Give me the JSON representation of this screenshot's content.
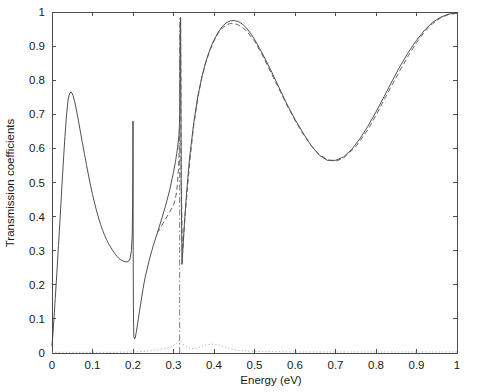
{
  "chart_data": {
    "type": "line",
    "title": "",
    "xlabel": "Energy   (eV)",
    "ylabel": "Transmission coefficients",
    "xlim": [
      0,
      1
    ],
    "ylim": [
      0,
      1
    ],
    "grid": false,
    "legend": "none",
    "xticks": [
      "0",
      "0.1",
      "0.2",
      "0.3",
      "0.4",
      "0.5",
      "0.6",
      "0.7",
      "0.8",
      "0.9",
      "1"
    ],
    "yticks": [
      "0",
      "0.1",
      "0.2",
      "0.3",
      "0.4",
      "0.5",
      "0.6",
      "0.7",
      "0.8",
      "0.9",
      "1"
    ],
    "xtick_values": [
      0,
      0.1,
      0.2,
      0.3,
      0.4,
      0.5,
      0.6,
      0.7,
      0.8,
      0.9,
      1
    ],
    "ytick_values": [
      0,
      0.1,
      0.2,
      0.3,
      0.4,
      0.5,
      0.6,
      0.7,
      0.8,
      0.9,
      1
    ],
    "annotations": [
      {
        "label": "first resonance peak",
        "x": 0.05,
        "y": 0.765
      },
      {
        "label": "local minimum",
        "x": 0.16,
        "y": 0.265
      },
      {
        "label": "Fano antiresonance",
        "x": 0.2,
        "y": 0.04
      },
      {
        "label": "sharp resonance spike",
        "x": 0.315,
        "y": 0.98
      },
      {
        "label": "broad transmission maximum",
        "x": 0.45,
        "y": 0.975
      },
      {
        "label": "broad minimum",
        "x": 0.65,
        "y": 0.565
      },
      {
        "label": "approach to unity",
        "x": 1.0,
        "y": 0.995
      }
    ],
    "series": [
      {
        "name": "solid",
        "style": "solid",
        "color": "#3c3c3c",
        "x": [
          0,
          0.004,
          0.008,
          0.012,
          0.016,
          0.02,
          0.024,
          0.028,
          0.032,
          0.036,
          0.04,
          0.044,
          0.048,
          0.052,
          0.056,
          0.06,
          0.065,
          0.07,
          0.075,
          0.08,
          0.085,
          0.09,
          0.095,
          0.1,
          0.105,
          0.11,
          0.115,
          0.12,
          0.125,
          0.13,
          0.135,
          0.14,
          0.145,
          0.15,
          0.155,
          0.16,
          0.165,
          0.17,
          0.175,
          0.18,
          0.185,
          0.19,
          0.193,
          0.196,
          0.198,
          0.199,
          0.1995,
          0.1998,
          0.2,
          0.2002,
          0.2005,
          0.201,
          0.2015,
          0.202,
          0.203,
          0.205,
          0.208,
          0.212,
          0.216,
          0.22,
          0.225,
          0.23,
          0.24,
          0.25,
          0.26,
          0.27,
          0.28,
          0.29,
          0.3,
          0.305,
          0.308,
          0.31,
          0.312,
          0.3135,
          0.3145,
          0.3152,
          0.3158,
          0.3163,
          0.3168,
          0.3175,
          0.319,
          0.321,
          0.324,
          0.328,
          0.333,
          0.34,
          0.35,
          0.36,
          0.37,
          0.38,
          0.39,
          0.4,
          0.41,
          0.42,
          0.43,
          0.44,
          0.45,
          0.46,
          0.47,
          0.48,
          0.49,
          0.5,
          0.52,
          0.54,
          0.56,
          0.58,
          0.6,
          0.62,
          0.64,
          0.66,
          0.68,
          0.7,
          0.72,
          0.74,
          0.76,
          0.78,
          0.8,
          0.82,
          0.84,
          0.86,
          0.88,
          0.9,
          0.92,
          0.94,
          0.96,
          0.98,
          1
        ],
        "y": [
          0.02,
          0.085,
          0.16,
          0.235,
          0.315,
          0.395,
          0.48,
          0.56,
          0.635,
          0.7,
          0.745,
          0.763,
          0.765,
          0.755,
          0.737,
          0.715,
          0.683,
          0.65,
          0.617,
          0.585,
          0.553,
          0.522,
          0.492,
          0.465,
          0.44,
          0.417,
          0.396,
          0.377,
          0.36,
          0.345,
          0.331,
          0.32,
          0.31,
          0.3,
          0.292,
          0.284,
          0.278,
          0.273,
          0.27,
          0.268,
          0.267,
          0.27,
          0.278,
          0.3,
          0.34,
          0.42,
          0.5,
          0.6,
          0.68,
          0.5,
          0.3,
          0.14,
          0.075,
          0.05,
          0.043,
          0.042,
          0.06,
          0.09,
          0.122,
          0.152,
          0.19,
          0.222,
          0.272,
          0.315,
          0.352,
          0.39,
          0.43,
          0.475,
          0.53,
          0.562,
          0.585,
          0.602,
          0.622,
          0.64,
          0.66,
          0.7,
          0.78,
          0.88,
          0.95,
          0.98,
          0.5,
          0.26,
          0.32,
          0.4,
          0.48,
          0.575,
          0.675,
          0.752,
          0.81,
          0.855,
          0.89,
          0.918,
          0.94,
          0.957,
          0.968,
          0.974,
          0.975,
          0.972,
          0.965,
          0.953,
          0.938,
          0.92,
          0.877,
          0.83,
          0.78,
          0.73,
          0.685,
          0.645,
          0.608,
          0.58,
          0.565,
          0.565,
          0.575,
          0.597,
          0.628,
          0.665,
          0.707,
          0.752,
          0.798,
          0.842,
          0.882,
          0.917,
          0.947,
          0.97,
          0.985,
          0.994,
          0.997
        ]
      },
      {
        "name": "dashed",
        "style": "dashed",
        "color": "#555555",
        "x": [
          0.26,
          0.28,
          0.3,
          0.305,
          0.308,
          0.31,
          0.3125,
          0.3138,
          0.3148,
          0.3156,
          0.3162,
          0.3168,
          0.3176,
          0.319,
          0.322,
          0.326,
          0.332,
          0.34,
          0.35,
          0.36,
          0.37,
          0.38,
          0.39,
          0.4,
          0.41,
          0.42,
          0.43,
          0.44,
          0.45,
          0.46,
          0.47,
          0.48,
          0.5,
          0.52,
          0.55,
          0.58,
          0.6,
          0.62,
          0.64,
          0.66,
          0.68,
          0.7,
          0.72,
          0.75,
          0.78,
          0.8,
          0.83,
          0.86,
          0.88,
          0.9,
          0.92,
          0.94,
          0.96,
          0.98,
          1
        ],
        "y": [
          0.352,
          0.392,
          0.433,
          0.455,
          0.475,
          0.5,
          0.545,
          0.6,
          0.68,
          0.78,
          0.88,
          0.95,
          0.985,
          0.52,
          0.29,
          0.36,
          0.45,
          0.56,
          0.668,
          0.748,
          0.808,
          0.853,
          0.888,
          0.915,
          0.937,
          0.952,
          0.962,
          0.966,
          0.966,
          0.962,
          0.955,
          0.945,
          0.915,
          0.872,
          0.8,
          0.727,
          0.682,
          0.642,
          0.608,
          0.582,
          0.567,
          0.562,
          0.572,
          0.605,
          0.655,
          0.697,
          0.765,
          0.83,
          0.872,
          0.91,
          0.942,
          0.966,
          0.983,
          0.993,
          0.996
        ]
      },
      {
        "name": "dashdot-spike",
        "style": "dashdot",
        "color": "#6e6e6e",
        "x": [
          0.3152,
          0.3152
        ],
        "y": [
          0.0,
          0.985
        ]
      },
      {
        "name": "dotted-background",
        "style": "dotted",
        "color": "#9a9a9a",
        "x": [
          0,
          0.05,
          0.1,
          0.15,
          0.2,
          0.23,
          0.26,
          0.28,
          0.295,
          0.305,
          0.312,
          0.315,
          0.318,
          0.325,
          0.335,
          0.345,
          0.355,
          0.365,
          0.375,
          0.385,
          0.395,
          0.405,
          0.415,
          0.425,
          0.435,
          0.445,
          0.46,
          0.48,
          0.5,
          0.52,
          0.55,
          0.6,
          0.65,
          0.7,
          0.75,
          0.8,
          0.85,
          0.9,
          0.95,
          1
        ],
        "y": [
          0.002,
          0.002,
          0.002,
          0.002,
          0.003,
          0.005,
          0.009,
          0.013,
          0.018,
          0.026,
          0.034,
          0.038,
          0.034,
          0.024,
          0.016,
          0.013,
          0.014,
          0.018,
          0.022,
          0.025,
          0.026,
          0.025,
          0.022,
          0.018,
          0.014,
          0.011,
          0.008,
          0.006,
          0.005,
          0.004,
          0.004,
          0.003,
          0.003,
          0.003,
          0.003,
          0.003,
          0.003,
          0.003,
          0.003,
          0.003
        ]
      }
    ]
  }
}
